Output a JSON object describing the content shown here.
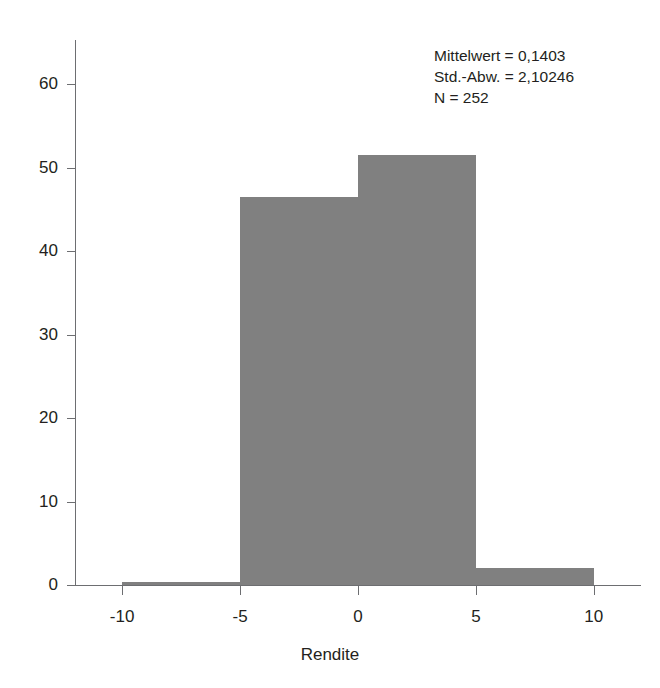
{
  "figure": {
    "title_remnant": "Histogramm",
    "background_color": "#ffffff",
    "bar_color": "#808080",
    "axis_color": "#6d6e71",
    "text_color": "#231f20"
  },
  "annotation": {
    "mean_line": "Mittelwert = 0,1403",
    "stddev_line": "Std.-Abw. = 2,10246",
    "n_line": "N = 252"
  },
  "chart_data": {
    "type": "bar",
    "title": "",
    "xlabel": "Rendite",
    "ylabel": "",
    "xlim": [
      -12.0,
      12.0
    ],
    "ylim": [
      0,
      64
    ],
    "grid": false,
    "legend": null,
    "bin_width": 5,
    "categories": [
      "-10 bis -5",
      "-5 bis 0",
      "0 bis 5",
      "5 bis 10"
    ],
    "bin_edges": [
      -10,
      -5,
      0,
      5,
      10
    ],
    "values": [
      0.3,
      46.5,
      51.5,
      2.0
    ],
    "xticks": [
      -10,
      -5,
      0,
      5,
      10
    ],
    "xtick_labels": [
      "-10",
      "-5",
      "0",
      "5",
      "10"
    ],
    "yticks": [
      0,
      10,
      20,
      30,
      40,
      50,
      60
    ],
    "ytick_labels": [
      "0",
      "10",
      "20",
      "30",
      "40",
      "50",
      "60"
    ],
    "annotations": [
      "Mittelwert = 0,1403",
      "Std.-Abw. = 2,10246",
      "N = 252"
    ]
  }
}
